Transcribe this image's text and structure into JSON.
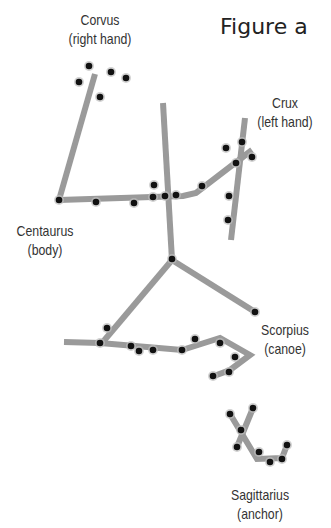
{
  "title": "Figure a",
  "colors": {
    "line": "#9a9a9a",
    "star": "#111111",
    "text": "#333333"
  },
  "constellations": [
    {
      "name": "Corvus",
      "role": "(right hand)"
    },
    {
      "name": "Crux",
      "role": "(left hand)"
    },
    {
      "name": "Centaurus",
      "role": "(body)"
    },
    {
      "name": "Scorpius",
      "role": "(canoe)"
    },
    {
      "name": "Sagittarius",
      "role": "(anchor)"
    }
  ],
  "lines": [
    [
      [
        95,
        74
      ],
      [
        59,
        200
      ]
    ],
    [
      [
        59,
        200
      ],
      [
        183,
        196
      ],
      [
        196,
        193
      ],
      [
        252,
        150
      ]
    ],
    [
      [
        163,
        103
      ],
      [
        172,
        260
      ]
    ],
    [
      [
        245,
        118
      ],
      [
        231,
        240
      ]
    ],
    [
      [
        172,
        260
      ],
      [
        102,
        343
      ]
    ],
    [
      [
        172,
        260
      ],
      [
        255,
        312
      ]
    ],
    [
      [
        64,
        342
      ],
      [
        100,
        343
      ],
      [
        182,
        350
      ],
      [
        220,
        338
      ],
      [
        250,
        355
      ],
      [
        230,
        370
      ],
      [
        214,
        376
      ]
    ],
    [
      [
        230,
        414
      ],
      [
        257,
        459
      ],
      [
        282,
        458
      ],
      [
        287,
        445
      ]
    ],
    [
      [
        253,
        408
      ],
      [
        237,
        447
      ]
    ]
  ],
  "stars": [
    [
      89,
      66
    ],
    [
      79,
      82
    ],
    [
      111,
      72
    ],
    [
      126,
      78
    ],
    [
      100,
      97
    ],
    [
      59,
      200
    ],
    [
      96,
      202
    ],
    [
      134,
      203
    ],
    [
      153,
      197
    ],
    [
      154,
      185
    ],
    [
      165,
      196
    ],
    [
      176,
      195
    ],
    [
      202,
      186
    ],
    [
      236,
      163
    ],
    [
      252,
      157
    ],
    [
      242,
      142
    ],
    [
      226,
      148
    ],
    [
      229,
      196
    ],
    [
      228,
      220
    ],
    [
      172,
      259
    ],
    [
      255,
      312
    ],
    [
      107,
      328
    ],
    [
      100,
      343
    ],
    [
      131,
      346
    ],
    [
      139,
      351
    ],
    [
      153,
      350
    ],
    [
      182,
      350
    ],
    [
      195,
      339
    ],
    [
      220,
      343
    ],
    [
      235,
      357
    ],
    [
      229,
      372
    ],
    [
      213,
      376
    ],
    [
      230,
      414
    ],
    [
      253,
      408
    ],
    [
      241,
      430
    ],
    [
      237,
      447
    ],
    [
      259,
      452
    ],
    [
      270,
      462
    ],
    [
      282,
      459
    ],
    [
      287,
      445
    ]
  ]
}
